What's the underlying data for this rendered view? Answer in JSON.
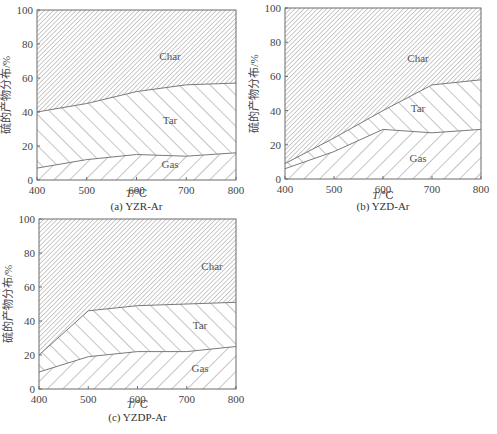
{
  "chart_data": [
    {
      "type": "area",
      "stacked": true,
      "title": "(a) YZR-Ar",
      "xlabel": "T/℃",
      "ylabel": "硫的产物分布/%",
      "x": [
        400,
        500,
        600,
        700,
        800
      ],
      "xlim": [
        400,
        800
      ],
      "ylim": [
        0,
        100
      ],
      "xticks": [
        "400",
        "500",
        "600",
        "700",
        "800"
      ],
      "yticks": [
        "0",
        "20",
        "40",
        "60",
        "80",
        "100"
      ],
      "grid": false,
      "series": [
        {
          "name": "Gas",
          "values": [
            7,
            12,
            15,
            14,
            16
          ]
        },
        {
          "name": "Tar",
          "values": [
            33,
            33,
            37,
            42,
            41
          ]
        },
        {
          "name": "Char",
          "values": [
            60,
            55,
            48,
            44,
            43
          ]
        }
      ],
      "cumulative_boundaries": {
        "gas_top": [
          7,
          12,
          15,
          14,
          16
        ],
        "tar_top": [
          40,
          45,
          52,
          56,
          57
        ]
      }
    },
    {
      "type": "area",
      "stacked": true,
      "title": "(b) YZD-Ar",
      "xlabel": "T/℃",
      "ylabel": "硫的产物分布/%",
      "x": [
        400,
        500,
        600,
        700,
        800
      ],
      "xlim": [
        400,
        800
      ],
      "ylim": [
        0,
        100
      ],
      "xticks": [
        "400",
        "500",
        "600",
        "700",
        "800"
      ],
      "yticks": [
        "0",
        "20",
        "40",
        "60",
        "80",
        "100"
      ],
      "grid": false,
      "series": [
        {
          "name": "Gas",
          "values": [
            6,
            16,
            29,
            27,
            29
          ]
        },
        {
          "name": "Tar",
          "values": [
            3,
            8,
            11,
            28,
            29
          ]
        },
        {
          "name": "Char",
          "values": [
            91,
            76,
            60,
            45,
            42
          ]
        }
      ],
      "cumulative_boundaries": {
        "gas_top": [
          6,
          16,
          29,
          27,
          29
        ],
        "tar_top": [
          9,
          24,
          40,
          55,
          58
        ]
      }
    },
    {
      "type": "area",
      "stacked": true,
      "title": "(c) YZDP-Ar",
      "xlabel": "T/℃",
      "ylabel": "硫的产物分布/%",
      "x": [
        400,
        500,
        600,
        700,
        800
      ],
      "xlim": [
        400,
        800
      ],
      "ylim": [
        0,
        100
      ],
      "xticks": [
        "400",
        "500",
        "600",
        "700",
        "800"
      ],
      "yticks": [
        "0",
        "20",
        "40",
        "60",
        "80",
        "100"
      ],
      "grid": false,
      "series": [
        {
          "name": "Gas",
          "values": [
            10,
            19,
            22,
            22,
            25
          ]
        },
        {
          "name": "Tar",
          "values": [
            10,
            27,
            27,
            28,
            26
          ]
        },
        {
          "name": "Char",
          "values": [
            80,
            54,
            51,
            50,
            49
          ]
        }
      ],
      "cumulative_boundaries": {
        "gas_top": [
          10,
          19,
          22,
          22,
          25
        ],
        "tar_top": [
          20,
          46,
          49,
          50,
          51
        ]
      }
    }
  ],
  "labels": {
    "ylabel": "硫的产物分布/%",
    "xlabel_italic": "T",
    "xlabel_unit": "/℃",
    "region_char": "Char",
    "region_tar": "Tar",
    "region_gas": "Gas",
    "caption_a": "(a) YZR-Ar",
    "caption_b": "(b) YZD-Ar",
    "caption_c": "(c) YZDP-Ar"
  },
  "colors": {
    "frame": "#6b6b6b",
    "hatch": "#6b6b6b",
    "text": "#444444"
  }
}
